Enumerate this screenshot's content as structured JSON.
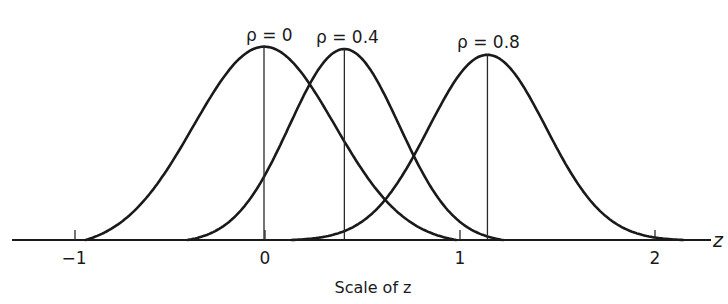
{
  "chart_data": {
    "type": "line",
    "title": "",
    "xlabel": "Scale of z",
    "axis_variable": "z",
    "ylabel": "",
    "xlim": [
      -1.3,
      2.3
    ],
    "x_ticks": [
      {
        "value": -1,
        "label": "−1"
      },
      {
        "value": 0,
        "label": "0"
      },
      {
        "value": 1,
        "label": "1"
      },
      {
        "value": 2,
        "label": "2"
      }
    ],
    "grid": false,
    "legend": "none (curves labeled directly above peaks)",
    "series": [
      {
        "name": "ρ=0",
        "label": "ρ = 0",
        "mean_z": 0.0,
        "sd_z": 0.36,
        "relative_peak": 1.0,
        "extent_z": [
          -0.91,
          0.98
        ],
        "mean_line": true
      },
      {
        "name": "ρ=0.4",
        "label": "ρ = 0.4",
        "mean_z": 0.41,
        "sd_z": 0.28,
        "relative_peak": 0.98,
        "extent_z": [
          -0.39,
          1.22
        ],
        "mean_line": true
      },
      {
        "name": "ρ=0.8",
        "label": "ρ = 0.8",
        "mean_z": 1.14,
        "sd_z": 0.3,
        "relative_peak": 0.95,
        "extent_z": [
          0.14,
          2.14
        ],
        "mean_line": true
      }
    ],
    "color": "#1a1a1a"
  },
  "labels": {
    "rho0": "ρ = 0",
    "rho04": "ρ = 0.4",
    "rho08": "ρ = 0.8",
    "tick_m1": "−1",
    "tick_0": "0",
    "tick_1": "1",
    "tick_2": "2",
    "axis_var": "z",
    "xlabel": "Scale of z"
  }
}
